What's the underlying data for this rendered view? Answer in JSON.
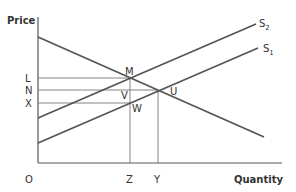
{
  "diagram": {
    "type": "supply-demand",
    "axes": {
      "y_title": "Price",
      "x_title": "Quantity",
      "origin": "O"
    },
    "price_labels": [
      {
        "label": "L",
        "y": 78
      },
      {
        "label": "N",
        "y": 90
      },
      {
        "label": "X",
        "y": 103
      }
    ],
    "quantity_labels": [
      {
        "label": "Z",
        "x": 130
      },
      {
        "label": "Y",
        "x": 158
      }
    ],
    "curves": {
      "demand": {
        "label": "",
        "from": [
          38,
          37
        ],
        "to": [
          264,
          137
        ]
      },
      "s2": {
        "label": "S",
        "sub": "2",
        "from": [
          38,
          118
        ],
        "to": [
          256,
          24
        ]
      },
      "s1": {
        "label": "S",
        "sub": "1",
        "from": [
          38,
          143
        ],
        "to": [
          258,
          48
        ]
      }
    },
    "points": {
      "M": "M",
      "U": "U",
      "V": "V",
      "W": "W"
    },
    "colors": {
      "curve": "#555555",
      "guide": "#777777",
      "text": "#333333"
    }
  }
}
